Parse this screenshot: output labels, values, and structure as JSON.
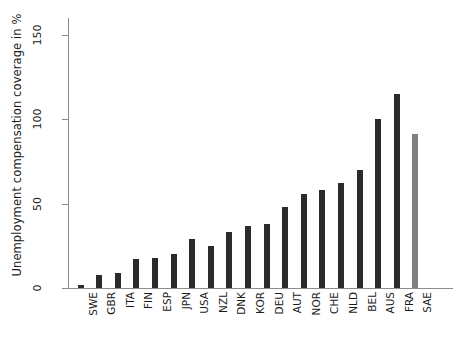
{
  "chart_data": {
    "type": "bar",
    "title": "",
    "xlabel": "",
    "ylabel": "Unemployment compensation coverage in %",
    "ylim": [
      0,
      160
    ],
    "yticks": [
      0,
      50,
      100,
      150
    ],
    "ytick_labels": [
      "0",
      "50",
      "100",
      "150"
    ],
    "grid": false,
    "legend": "none",
    "categories": [
      "SWE",
      "GBR",
      "ITA",
      "FIN",
      "ESP",
      "JPN",
      "USA",
      "NZL",
      "DNK",
      "KOR",
      "DEU",
      "AUT",
      "NOR",
      "CHE",
      "NLD",
      "BEL",
      "AUS",
      "FRA",
      "SAE"
    ],
    "values": [
      2,
      8,
      9,
      17,
      18,
      20,
      29,
      25,
      33,
      37,
      38,
      48,
      56,
      58,
      62,
      70,
      100,
      115,
      91
    ],
    "bars": [
      {
        "category": "SWE",
        "value": 2,
        "color": "#2b2b2b"
      },
      {
        "category": "GBR",
        "value": 8,
        "color": "#2b2b2b"
      },
      {
        "category": "ITA",
        "value": 9,
        "color": "#2b2b2b"
      },
      {
        "category": "FIN",
        "value": 17,
        "color": "#2b2b2b"
      },
      {
        "category": "ESP",
        "value": 18,
        "color": "#2b2b2b"
      },
      {
        "category": "JPN",
        "value": 20,
        "color": "#2b2b2b"
      },
      {
        "category": "USA",
        "value": 29,
        "color": "#2b2b2b"
      },
      {
        "category": "NZL",
        "value": 25,
        "color": "#2b2b2b"
      },
      {
        "category": "DNK",
        "value": 33,
        "color": "#2b2b2b"
      },
      {
        "category": "KOR",
        "value": 37,
        "color": "#2b2b2b"
      },
      {
        "category": "DEU",
        "value": 38,
        "color": "#2b2b2b"
      },
      {
        "category": "AUT",
        "value": 48,
        "color": "#2b2b2b"
      },
      {
        "category": "NOR",
        "value": 56,
        "color": "#2b2b2b"
      },
      {
        "category": "CHE",
        "value": 58,
        "color": "#2b2b2b"
      },
      {
        "category": "NLD",
        "value": 62,
        "color": "#2b2b2b"
      },
      {
        "category": "BEL",
        "value": 70,
        "color": "#2b2b2b"
      },
      {
        "category": "AUS",
        "value": 100,
        "color": "#2b2b2b"
      },
      {
        "category": "FRA",
        "value": 115,
        "color": "#2b2b2b"
      },
      {
        "category": "SAE",
        "value": 91,
        "color": "#808080"
      }
    ]
  },
  "caption": {
    "text": ""
  }
}
